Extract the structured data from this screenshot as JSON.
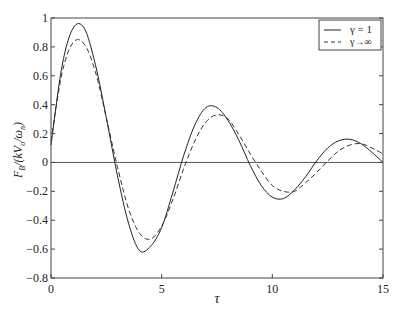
{
  "chart_data": {
    "type": "line",
    "title": "",
    "xlabel": "τ",
    "ylabel": "F_B/(kV_o/ω_n)",
    "xlim": [
      0,
      15
    ],
    "ylim": [
      -0.8,
      1
    ],
    "xticks": [
      0,
      5,
      10,
      15
    ],
    "xtick_labels": [
      "0",
      "5",
      "10",
      "15"
    ],
    "yticks": [
      -0.8,
      -0.6,
      -0.4,
      -0.2,
      0,
      0.2,
      0.4,
      0.6,
      0.8,
      1
    ],
    "ytick_labels": [
      "−0.8",
      "−0.6",
      "−0.4",
      "−0.2",
      "0",
      "0.2",
      "0.4",
      "0.6",
      "0.8",
      "1"
    ],
    "grid": false,
    "zero_line": true,
    "legend_position": "upper right",
    "x": [
      0,
      0.5,
      1,
      1.5,
      2,
      2.5,
      3,
      3.5,
      4,
      4.5,
      5,
      5.5,
      6,
      6.5,
      7,
      7.5,
      8,
      8.5,
      9,
      9.5,
      10,
      10.5,
      11,
      11.5,
      12,
      12.5,
      13,
      13.5,
      14,
      14.5,
      15
    ],
    "series": [
      {
        "name": "γ = 1",
        "style": "solid",
        "values": [
          0.12,
          0.67,
          0.93,
          0.93,
          0.68,
          0.31,
          -0.09,
          -0.42,
          -0.61,
          -0.58,
          -0.45,
          -0.21,
          0.05,
          0.26,
          0.38,
          0.38,
          0.29,
          0.15,
          -0.02,
          -0.16,
          -0.24,
          -0.25,
          -0.19,
          -0.1,
          0.01,
          0.1,
          0.15,
          0.16,
          0.13,
          0.07,
          0.0
        ]
      },
      {
        "name": "γ → ∞",
        "style": "dashed",
        "values": [
          0.15,
          0.62,
          0.83,
          0.82,
          0.63,
          0.31,
          -0.03,
          -0.32,
          -0.49,
          -0.53,
          -0.44,
          -0.26,
          -0.04,
          0.15,
          0.28,
          0.33,
          0.3,
          0.19,
          0.06,
          -0.06,
          -0.16,
          -0.2,
          -0.2,
          -0.14,
          -0.07,
          0.01,
          0.08,
          0.12,
          0.13,
          0.1,
          0.06
        ]
      }
    ]
  },
  "legend": {
    "entries": [
      "γ = 1",
      "γ→∞"
    ]
  },
  "axes": {
    "ylabel_main": "F",
    "ylabel_sub": "B",
    "ylabel_rest": "/(kV",
    "ylabel_sub2": "o",
    "ylabel_rest2": "/ω",
    "ylabel_sub3": "n",
    "ylabel_close": ")",
    "xlabel": "τ"
  }
}
